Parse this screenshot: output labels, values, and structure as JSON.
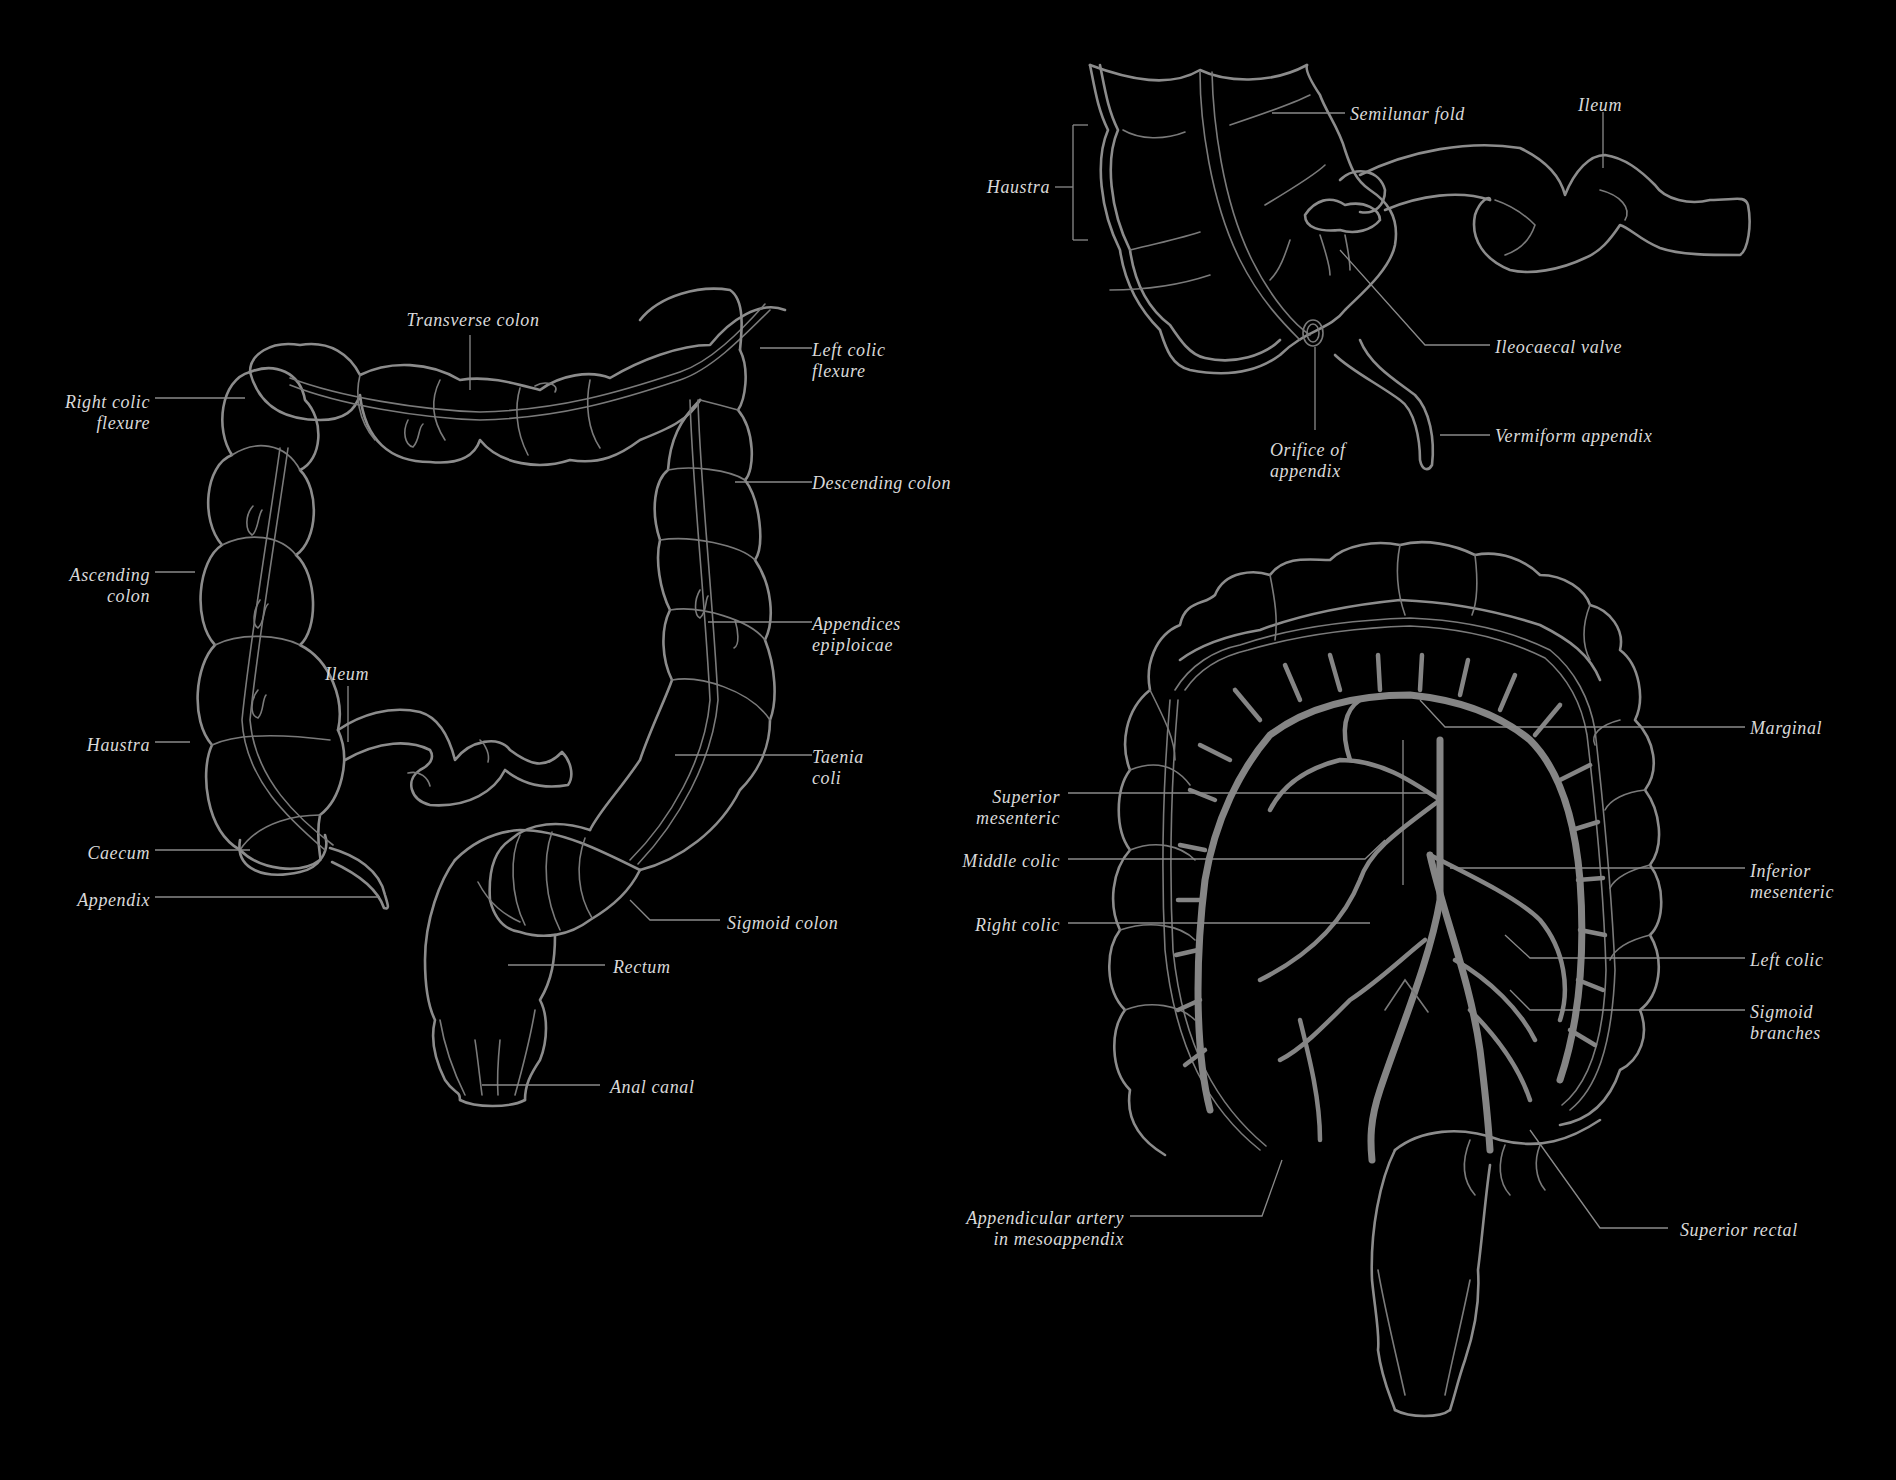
{
  "colors": {
    "background": "#000000",
    "outline": "#8c8c8c",
    "artery": "#858585",
    "leader_line": "#8a8a8a",
    "label_text": "#d9d9d9"
  },
  "diagrams": {
    "large_intestine": {
      "labels": {
        "transverse_colon": "Transverse colon",
        "left_colic_flexure": "Left colic\nflexure",
        "right_colic_flexure": "Right colic\nflexure",
        "descending_colon": "Descending colon",
        "ascending_colon": "Ascending\ncolon",
        "appendices_epiploicae": "Appendices\nepiploicae",
        "ileum": "Ileum",
        "haustra": "Haustra",
        "taenia_coli": "Taenia\ncoli",
        "caecum": "Caecum",
        "appendix": "Appendix",
        "sigmoid_colon": "Sigmoid colon",
        "rectum": "Rectum",
        "anal_canal": "Anal canal"
      }
    },
    "caecum_detail": {
      "labels": {
        "semilunar_fold": "Semilunar fold",
        "ileum": "Ileum",
        "haustra": "Haustra",
        "ileocaecal_valve": "Ileocaecal valve",
        "vermiform_appendix": "Vermiform appendix",
        "orifice_of_appendix": "Orifice of\nappendix"
      }
    },
    "arterial_supply": {
      "labels": {
        "marginal": "Marginal",
        "superior_mesenteric": "Superior\nmesenteric",
        "middle_colic": "Middle colic",
        "inferior_mesenteric": "Inferior\nmesenteric",
        "right_colic": "Right colic",
        "left_colic": "Left colic",
        "sigmoid_branches": "Sigmoid\nbranches",
        "appendicular_artery": "Appendicular artery\nin mesoappendix",
        "superior_rectal": "Superior rectal"
      }
    }
  }
}
